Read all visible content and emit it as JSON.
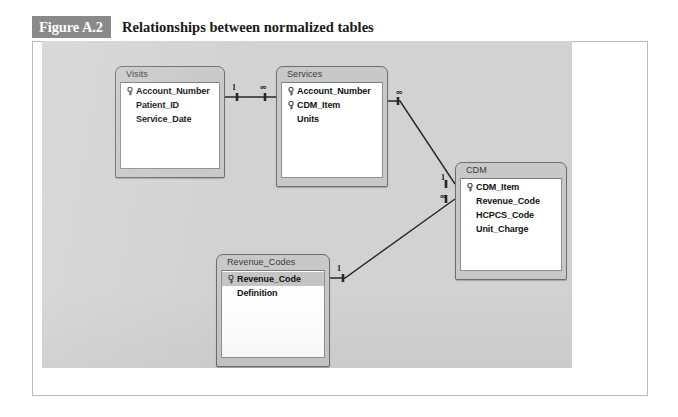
{
  "figure": {
    "number": "Figure A.2",
    "title": "Relationships between normalized tables"
  },
  "colors": {
    "caption_badge_bg": "#8a8a8a",
    "caption_badge_text": "#ffffff",
    "canvas_bg": "#d2d2d2",
    "table_chrome": "#c8c8c8",
    "table_body_bg": "#ffffff",
    "line": "#262626",
    "selected_row_bg": "#c4c4c4"
  },
  "diagram": {
    "type": "entity-relationship",
    "tables": [
      {
        "name": "Visits",
        "x": 115,
        "y": 66,
        "width": 110,
        "height": 112,
        "fields": [
          {
            "label": "Account_Number",
            "primary_key": true,
            "selected": false
          },
          {
            "label": "Patient_ID",
            "primary_key": false,
            "selected": false
          },
          {
            "label": "Service_Date",
            "primary_key": false,
            "selected": false
          }
        ]
      },
      {
        "name": "Services",
        "x": 276,
        "y": 66,
        "width": 112,
        "height": 121,
        "fields": [
          {
            "label": "Account_Number",
            "primary_key": true,
            "selected": false
          },
          {
            "label": "CDM_Item",
            "primary_key": true,
            "selected": false
          },
          {
            "label": "Units",
            "primary_key": false,
            "selected": false
          }
        ]
      },
      {
        "name": "CDM",
        "x": 455,
        "y": 162,
        "width": 112,
        "height": 118,
        "fields": [
          {
            "label": "CDM_Item",
            "primary_key": true,
            "selected": false
          },
          {
            "label": "Revenue_Code",
            "primary_key": false,
            "selected": false
          },
          {
            "label": "HCPCS_Code",
            "primary_key": false,
            "selected": false
          },
          {
            "label": "Unit_Charge",
            "primary_key": false,
            "selected": false
          }
        ]
      },
      {
        "name": "Revenue_Codes",
        "x": 216,
        "y": 254,
        "width": 114,
        "height": 113,
        "fields": [
          {
            "label": "Revenue_Code",
            "primary_key": true,
            "selected": true
          },
          {
            "label": "Definition",
            "primary_key": false,
            "selected": false
          }
        ]
      }
    ],
    "relationships": [
      {
        "id": "visits-services",
        "from_table": "Visits",
        "from_field": "Account_Number",
        "to_table": "Services",
        "to_field": "Account_Number",
        "from_cardinality": "1",
        "to_cardinality": "∞",
        "path": "M 225 97 L 276 97",
        "from_tick": "M 237 93 L 237 101",
        "to_tick": "M 265 93 L 265 101",
        "from_label_pos": {
          "x": 232,
          "y": 84
        },
        "to_label_pos": {
          "x": 260,
          "y": 83
        }
      },
      {
        "id": "services-cdm",
        "from_table": "Services",
        "from_field": "CDM_Item",
        "to_table": "CDM",
        "to_field": "CDM_Item",
        "from_cardinality": "∞",
        "to_cardinality": "1",
        "path": "M 388 101 L 400 101 L 455 184",
        "from_tick": "M 398 97 L 398 105",
        "to_tick": "M 446 180 L 446 188",
        "from_label_pos": {
          "x": 396,
          "y": 88
        },
        "to_label_pos": {
          "x": 441,
          "y": 174
        }
      },
      {
        "id": "revenuecodes-cdm",
        "from_table": "Revenue_Codes",
        "from_field": "Revenue_Code",
        "to_table": "CDM",
        "to_field": "Revenue_Code",
        "from_cardinality": "1",
        "to_cardinality": "∞",
        "path": "M 330 278 L 345 278 L 455 199",
        "from_tick": "M 343 274 L 343 282",
        "to_tick": "M 446 195 L 446 203",
        "from_label_pos": {
          "x": 337,
          "y": 265
        },
        "to_label_pos": {
          "x": 440,
          "y": 192
        }
      }
    ]
  }
}
